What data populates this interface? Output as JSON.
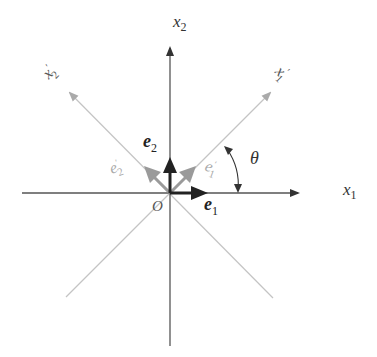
{
  "diagram": {
    "origin_label": "O",
    "axes": {
      "x1": {
        "label": "x",
        "sub": "1"
      },
      "x2": {
        "label": "x",
        "sub": "2"
      },
      "x1_prime": {
        "label": "x",
        "sub": "1",
        "prime": "′"
      },
      "x2_prime": {
        "label": "x",
        "sub": "2",
        "prime": "′"
      }
    },
    "basis_vectors": {
      "e1": {
        "label": "e",
        "sub": "1"
      },
      "e2": {
        "label": "e",
        "sub": "2"
      },
      "e1_prime": {
        "label": "e",
        "sub": "1",
        "prime": "′"
      },
      "e2_prime": {
        "label": "e",
        "sub": "2",
        "prime": "′"
      }
    },
    "angle_label": "θ",
    "colors": {
      "axis": "#333333",
      "rotated_axis": "#bbbbbb",
      "rotated_vector": "#999999",
      "basis_vector": "#222222",
      "rotated_label": "#aaaaaa"
    }
  }
}
